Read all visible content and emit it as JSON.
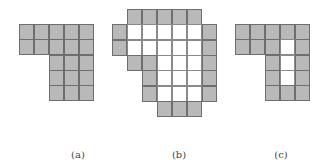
{
  "figures": [
    {
      "id": "a",
      "caption": "(a)",
      "grid": [
        "GGGGG",
        "GGGGG",
        "..GGG",
        "..GGG",
        "..GGG"
      ]
    },
    {
      "id": "b",
      "caption": "(b)",
      "grid": [
        ".GGGGG.",
        "GWWWWWG",
        "GWWWWWG",
        ".GGWWWG",
        "..GWWWG",
        "..GWWWG",
        "...GGG."
      ]
    },
    {
      "id": "c",
      "caption": "(c)",
      "grid": [
        "GGGGG",
        "GGGWG",
        "..GWG",
        "..GWG",
        "..GGG"
      ]
    }
  ],
  "legend": {
    "G": "gray cell",
    "W": "white cell",
    ".": "empty"
  }
}
